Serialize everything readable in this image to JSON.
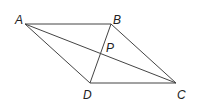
{
  "diagram": {
    "type": "parallelogram-with-diagonals",
    "stroke_color": "#444444",
    "label_color": "#222222",
    "points": {
      "A": {
        "x": 25,
        "y": 24,
        "label": "A",
        "lx": 15,
        "ly": 24
      },
      "B": {
        "x": 111,
        "y": 24,
        "label": "B",
        "lx": 113,
        "ly": 24
      },
      "C": {
        "x": 176,
        "y": 83,
        "label": "C",
        "lx": 177,
        "ly": 99
      },
      "D": {
        "x": 90,
        "y": 83,
        "label": "D",
        "lx": 83,
        "ly": 99
      },
      "P": {
        "x": 101,
        "y": 55,
        "label": "P",
        "lx": 106,
        "ly": 52
      }
    },
    "segments": [
      [
        "A",
        "B"
      ],
      [
        "B",
        "C"
      ],
      [
        "C",
        "D"
      ],
      [
        "D",
        "A"
      ],
      [
        "A",
        "C"
      ],
      [
        "B",
        "D"
      ]
    ]
  }
}
